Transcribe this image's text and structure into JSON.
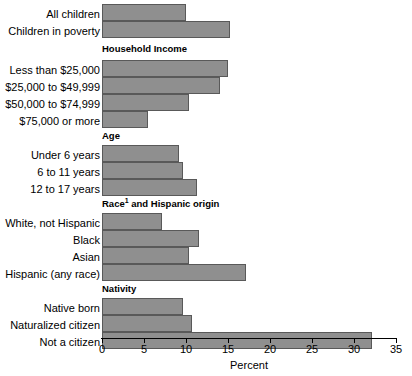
{
  "chart_data": {
    "type": "bar",
    "orientation": "horizontal",
    "title": "",
    "xlabel": "Percent",
    "ylabel": "",
    "xlim": [
      0,
      35
    ],
    "xticks": [
      0,
      5,
      10,
      15,
      20,
      25,
      30,
      35
    ],
    "xtick_labels": [
      "0",
      "5",
      "10",
      "15",
      "20",
      "25",
      "30",
      "35"
    ],
    "grid": false,
    "legend": null,
    "bar_color": "#8f8f8f",
    "bar_edge_color": "#595959",
    "groups": [
      {
        "header": "",
        "header_footnote": "",
        "categories": [
          "All children",
          "Children in poverty"
        ],
        "values": [
          10.0,
          15.2
        ]
      },
      {
        "header": "Household Income",
        "header_footnote": "",
        "categories": [
          "Less than $25,000",
          "$25,000 to $49,999",
          "$50,000 to $74,999",
          "$75,000 or more"
        ],
        "values": [
          15.0,
          14.1,
          10.3,
          5.5
        ]
      },
      {
        "header": "Age",
        "header_footnote": "",
        "categories": [
          "Under 6 years",
          "6 to 11 years",
          "12 to 17 years"
        ],
        "values": [
          9.2,
          9.6,
          11.3
        ]
      },
      {
        "header": "Race and Hispanic origin",
        "header_footnote": "1",
        "categories": [
          "White, not Hispanic",
          "Black",
          "Asian",
          "Hispanic (any race)"
        ],
        "values": [
          7.1,
          11.5,
          10.3,
          17.1
        ]
      },
      {
        "header": "Nativity",
        "header_footnote": "",
        "categories": [
          "Native born",
          "Naturalized citizen",
          "Not a citizen"
        ],
        "values": [
          9.6,
          10.7,
          32.1
        ]
      }
    ]
  }
}
